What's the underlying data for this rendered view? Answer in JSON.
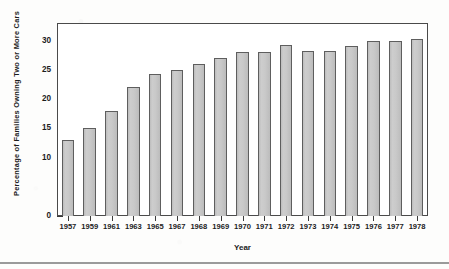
{
  "chart_data": {
    "type": "bar",
    "title": "",
    "xlabel": "Year",
    "ylabel": "Percentage of Families Owning Two or More Cars",
    "categories": [
      "1957",
      "1959",
      "1961",
      "1963",
      "1965",
      "1967",
      "1968",
      "1969",
      "1970",
      "1971",
      "1972",
      "1973",
      "1974",
      "1975",
      "1976",
      "1977",
      "1978"
    ],
    "values": [
      13.0,
      15.1,
      18.0,
      22.0,
      24.2,
      25.0,
      26.0,
      27.1,
      28.1,
      28.1,
      29.2,
      28.2,
      28.2,
      29.1,
      30.0,
      30.0,
      30.3
    ],
    "ylim": [
      0,
      33
    ],
    "yticks": [
      0,
      10,
      15,
      20,
      25,
      30
    ],
    "ytick_labels": [
      "0",
      "10",
      "15",
      "20",
      "25",
      "30"
    ],
    "grid": false,
    "legend": false,
    "legend_position": "none",
    "series": [
      {
        "name": "Percentage of Families Owning Two or More Cars",
        "values": [
          13.0,
          15.1,
          18.0,
          22.0,
          24.2,
          25.0,
          26.0,
          27.1,
          28.1,
          28.1,
          29.2,
          28.2,
          28.2,
          29.1,
          30.0,
          30.0,
          30.3
        ]
      }
    ],
    "colors": {
      "bar_fill": "#c9c9c9",
      "bar_edge": "#5e5e5e",
      "axis": "#4a4a4a",
      "text": "#1c1c1c",
      "background": "#ffffff"
    }
  }
}
